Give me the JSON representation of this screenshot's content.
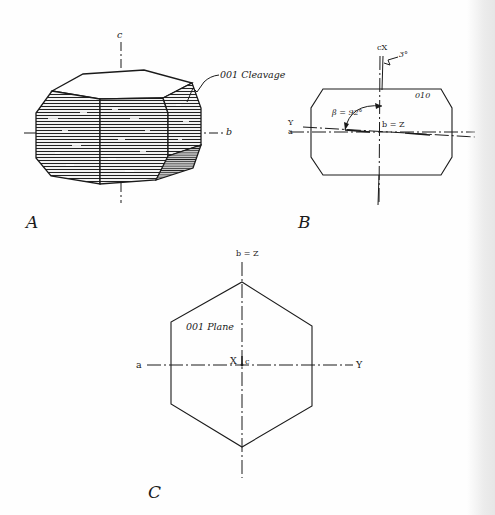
{
  "figure": {
    "panels": [
      {
        "id": "A",
        "letter": "A",
        "description": "Perspective drawing of hexagonal prismatic crystal with striated cleavage faces",
        "labels": {
          "c_axis": "c",
          "b_axis": "b",
          "cleavage": "001 Cleavage"
        }
      },
      {
        "id": "B",
        "letter": "B",
        "description": "Section parallel to 010 showing optic orientation",
        "labels": {
          "cx": "cX",
          "angle_small": "3°",
          "face": "010",
          "beta": "β = 92°",
          "bz": "b = Z",
          "y_axis": "Y",
          "a_axis": "a"
        }
      },
      {
        "id": "C",
        "letter": "C",
        "description": "Basal section (001 plane) hexagon with crystallographic and optic axes",
        "labels": {
          "bz": "b = Z",
          "plane": "001 Plane",
          "a_axis": "a",
          "y_axis": "Y",
          "x": "X",
          "c": "c"
        }
      }
    ],
    "colors": {
      "ink": "#1a1a1a",
      "paper": "#fefefe"
    }
  }
}
